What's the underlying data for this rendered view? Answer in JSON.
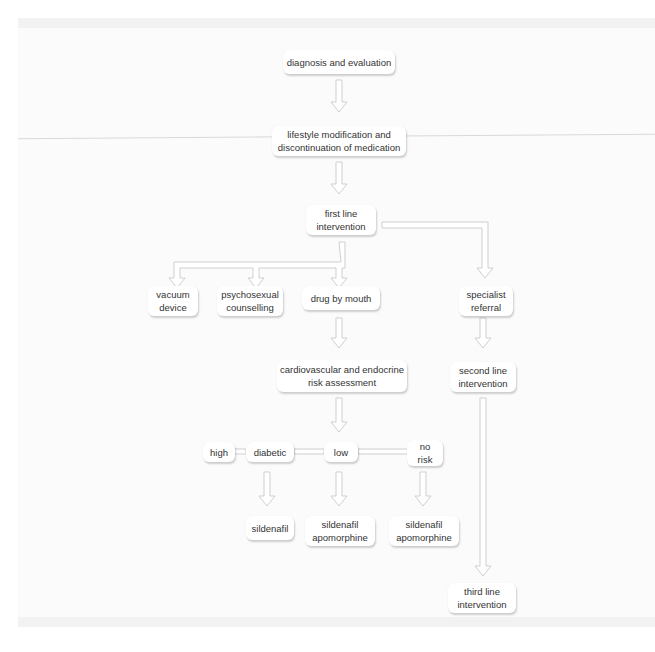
{
  "diagram": {
    "nodes": {
      "diagnosis": "diagnosis and evaluation",
      "lifestyle": "lifestyle modification and\ndiscontinuation of medication",
      "first_line": "first line\nintervention",
      "vacuum": "vacuum\ndevice",
      "psychosexual": "psychosexual\ncounselling",
      "drug": "drug by mouth",
      "specialist": "specialist\nreferral",
      "risk": "cardiovascular and endocrine\nrisk assessment",
      "second_line": "second line\nintervention",
      "high": "high",
      "diabetic": "diabetic",
      "low": "low",
      "no_risk": "no\nrisk",
      "sildenafil_diabetic": "sildenafil",
      "sildenafil_low": "sildenafil\napomorphine",
      "sildenafil_norisk": "sildenafil\napomorphine",
      "third_line": "third line\nintervention"
    },
    "edges": [
      [
        "diagnosis",
        "lifestyle"
      ],
      [
        "lifestyle",
        "first_line"
      ],
      [
        "first_line",
        "vacuum"
      ],
      [
        "first_line",
        "psychosexual"
      ],
      [
        "first_line",
        "drug"
      ],
      [
        "first_line",
        "specialist"
      ],
      [
        "drug",
        "risk"
      ],
      [
        "specialist",
        "second_line"
      ],
      [
        "risk",
        "low"
      ],
      [
        "diabetic",
        "sildenafil_diabetic"
      ],
      [
        "low",
        "sildenafil_low"
      ],
      [
        "no_risk",
        "sildenafil_norisk"
      ],
      [
        "second_line",
        "third_line"
      ]
    ],
    "colors": {
      "box": "#ffffff",
      "arrow": "#d0d0d0",
      "text": "#333333",
      "background": "#fbfbfb"
    }
  }
}
